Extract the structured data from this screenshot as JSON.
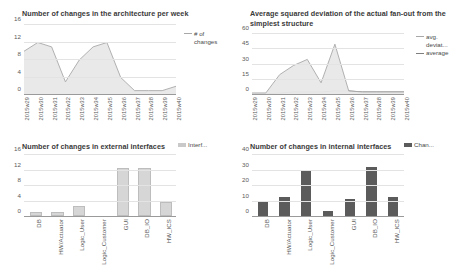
{
  "charts": {
    "architecture": {
      "title": "Number of changes in the architecture per week",
      "legend": [
        "# of changes"
      ]
    },
    "fanout": {
      "title": "Average squared deviation of the actual fan-out from the simplest structure",
      "legend": [
        "avg. deviat...",
        "average"
      ]
    },
    "external": {
      "title": "Number of changes in external interfaces",
      "legend": [
        "Interf..."
      ]
    },
    "internal": {
      "title": "Number of changes in internal interfaces",
      "legend": [
        "Chan..."
      ]
    }
  },
  "chart_data": [
    {
      "id": "architecture",
      "type": "area",
      "title": "Number of changes in the architecture per week",
      "xlabel": "",
      "ylabel": "",
      "ylim": [
        0,
        16
      ],
      "yticks": [
        0,
        4,
        8,
        12,
        16
      ],
      "grid": true,
      "legend": [
        "# of changes"
      ],
      "legend_position": "right",
      "x": [
        "2015w29",
        "2015w30",
        "2015w31",
        "2015w32",
        "2015w33",
        "2015w34",
        "2015w35",
        "2015w36",
        "2015w37",
        "2015w38",
        "2015w39",
        "2015w40"
      ],
      "series": [
        {
          "name": "# of changes",
          "values": [
            10,
            12,
            11,
            3,
            8,
            11,
            12,
            4,
            1,
            1,
            1,
            2
          ]
        }
      ]
    },
    {
      "id": "fanout",
      "type": "area",
      "title": "Average squared deviation of the actual fan-out from the simplest structure",
      "xlabel": "",
      "ylabel": "",
      "ylim": [
        0,
        60
      ],
      "yticks": [
        0,
        15,
        30,
        45,
        60
      ],
      "grid": true,
      "legend": [
        "avg. deviat...",
        "average"
      ],
      "legend_position": "right",
      "x": [
        "2015w29",
        "2015w30",
        "2015w31",
        "2015w32",
        "2015w33",
        "2015w34",
        "2015w35",
        "2015w36",
        "2015w37",
        "2015w38",
        "2015w39",
        "2015w40"
      ],
      "series": [
        {
          "name": "avg. deviat...",
          "values": [
            2,
            2,
            20,
            29,
            35,
            12,
            50,
            4,
            3,
            3,
            3,
            3
          ]
        },
        {
          "name": "average",
          "values": [
            1,
            1,
            2,
            3,
            3,
            3,
            4,
            4,
            3,
            3,
            3,
            3
          ]
        }
      ]
    },
    {
      "id": "external",
      "type": "bar",
      "title": "Number of changes in external interfaces",
      "xlabel": "",
      "ylabel": "",
      "ylim": [
        0,
        16
      ],
      "yticks": [
        0,
        4,
        8,
        12,
        16
      ],
      "grid": true,
      "legend": [
        "Interf..."
      ],
      "legend_position": "right",
      "categories": [
        "DB",
        "HW/Actuator",
        "Logic_User",
        "Logic_Customer",
        "GUI",
        "DB_IO",
        "HW_ICS"
      ],
      "values": [
        0.5,
        0.6,
        2,
        0,
        12,
        12,
        3
      ]
    },
    {
      "id": "internal",
      "type": "bar",
      "title": "Number of changes in internal interfaces",
      "xlabel": "",
      "ylabel": "",
      "ylim": [
        0,
        40
      ],
      "yticks": [
        0,
        10,
        20,
        30,
        40
      ],
      "grid": true,
      "legend": [
        "Chan..."
      ],
      "legend_position": "right",
      "categories": [
        "DB",
        "HW/Actuator",
        "Logic_User",
        "Logic_Customer",
        "GUI",
        "DB_IO",
        "HW_ICS"
      ],
      "values": [
        9.5,
        12.5,
        29,
        3.5,
        11,
        31.5,
        12.5
      ]
    }
  ],
  "colors": {
    "area_fill": "#e8e8e8",
    "area_stroke": "#a8a8a8",
    "area_fill_2": "#dcdcdc",
    "area_stroke_2": "#7e7e7e",
    "bar_light": "#d6d6d6",
    "bar_dark": "#5b5b5b",
    "grid": "#e3e3e3",
    "axis": "#9a9a9a",
    "text": "#4a4a4a"
  }
}
